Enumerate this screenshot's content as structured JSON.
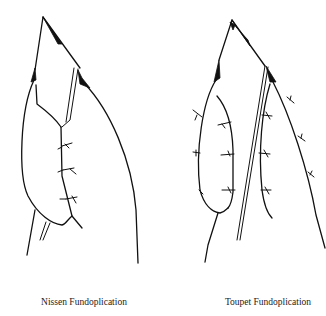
{
  "figure": {
    "panels": [
      {
        "id": "nissen",
        "caption": "Nissen Fundoplication"
      },
      {
        "id": "toupet",
        "caption": "Toupet Fundoplication"
      }
    ]
  }
}
